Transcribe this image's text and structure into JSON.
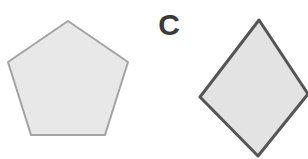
{
  "canvas": {
    "width": 308,
    "height": 159,
    "background_color": "#ffffff"
  },
  "label": {
    "text": "C",
    "color": "#3a3a3a",
    "name": "shape-group-label-c"
  },
  "shapes": [
    {
      "id": "pentagon",
      "kind": "pentagon",
      "sides": 5,
      "fill_color": "#e8e8e8",
      "stroke_color": "#a3a3a3",
      "stroke_width": 2,
      "points": "68,21 128,62 105,135 31,135 8,62",
      "clipped": false
    },
    {
      "id": "diamond",
      "kind": "square-rotated",
      "sides": 4,
      "fill_color": "#e3e3e3",
      "stroke_color": "#555555",
      "stroke_width": 3,
      "points": "259,20 308,94 258,156 200,97",
      "clipped": true
    }
  ]
}
